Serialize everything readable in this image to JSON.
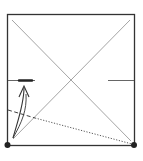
{
  "diagram": {
    "type": "origami-fold-step",
    "colors": {
      "edge": "#333333",
      "crease": "#9a9a9a",
      "fold_line": "#444444",
      "arrow": "#333333",
      "point": "#222222",
      "background": "#ffffff"
    },
    "elements": {
      "square": "paper-square",
      "diagonals": [
        "crease-diagonal-1",
        "crease-diagonal-2"
      ],
      "marks": [
        "left-reference-mark",
        "right-reference-mark",
        "target-mark"
      ],
      "fold_lines": [
        "valley-fold-dashed",
        "hidden-edge-dotted"
      ],
      "arrow": "fold-arrow",
      "points": [
        "bottom-left-reference-point",
        "bottom-right-reference-point"
      ]
    }
  }
}
